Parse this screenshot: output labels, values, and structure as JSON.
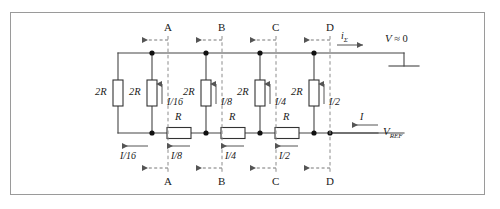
{
  "figure": {
    "type": "circuit-schematic",
    "border_color": "#9a9a9a",
    "wire_color": "#444444",
    "dashed_color": "#8c8c8c"
  },
  "top_nodes": [
    {
      "letter": "A",
      "x": 168
    },
    {
      "letter": "B",
      "x": 222
    },
    {
      "letter": "C",
      "x": 276
    },
    {
      "letter": "D",
      "x": 330
    }
  ],
  "bottom_nodes": [
    {
      "letter": "A",
      "x": 168
    },
    {
      "letter": "B",
      "x": 222
    },
    {
      "letter": "C",
      "x": 276
    },
    {
      "letter": "D",
      "x": 330
    }
  ],
  "vertical_resistors": [
    {
      "label": "2R",
      "x": 118,
      "current": ""
    },
    {
      "label": "2R",
      "x": 152,
      "current": "I/16"
    },
    {
      "label": "2R",
      "x": 206,
      "current": "I/8"
    },
    {
      "label": "2R",
      "x": 260,
      "current": "I/4"
    },
    {
      "label": "2R",
      "x": 314,
      "current": "I/2"
    }
  ],
  "series_resistors": [
    {
      "label": "R",
      "x": 179,
      "current": "I/8"
    },
    {
      "label": "R",
      "x": 233,
      "current": "I/4"
    },
    {
      "label": "R",
      "x": 287,
      "current": "I/2"
    }
  ],
  "bottom_left_current": "I/16",
  "terminals": {
    "output_current_symbol": "i",
    "output_current_subscript": "Σ",
    "virtual_ground_voltage": "V",
    "virtual_ground_relation": "≈ 0",
    "reference_voltage": "V",
    "reference_subscript": "REF",
    "input_current": "I"
  }
}
